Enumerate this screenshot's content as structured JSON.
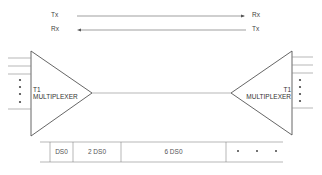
{
  "link": {
    "left_top": "Tx",
    "left_bottom": "Rx",
    "right_top": "Rx",
    "right_bottom": "Tx"
  },
  "left_mux": {
    "line1": "T1",
    "line2": "MULTIPLEXER"
  },
  "right_mux": {
    "line1": "T1",
    "line2": "MULTIPLEXER"
  },
  "frame": {
    "cells": [
      "DS0",
      "2 DS0",
      "6 DS0"
    ],
    "continuation": "• • •"
  },
  "colors": {
    "line": "#555555",
    "text": "#444444"
  }
}
